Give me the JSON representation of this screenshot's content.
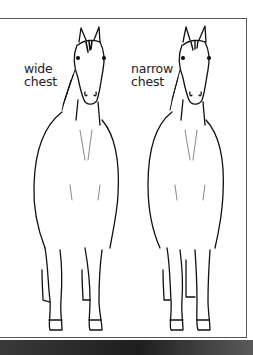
{
  "figure": {
    "labels": {
      "wide": [
        "wide",
        "chest"
      ],
      "narrow": [
        "narrow",
        "chest"
      ]
    },
    "subjects": [
      {
        "name": "horse-wide-chest",
        "description": "front view horse line drawing with wide chest"
      },
      {
        "name": "horse-narrow-chest",
        "description": "front view horse line drawing with narrow chest"
      }
    ],
    "colors": {
      "line": "#111111",
      "frame": "#555555",
      "background": "#ffffff",
      "bottom_band": "#2a2a2a"
    }
  }
}
